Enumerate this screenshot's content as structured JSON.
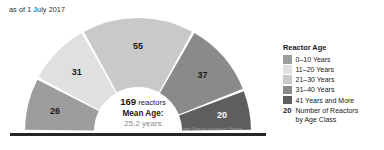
{
  "asof": "as of 1 July 2017",
  "center": {
    "total": "169",
    "total_unit": "reactors",
    "mean_label": "Mean Age:",
    "mean_value": "25.2 years"
  },
  "credit": "IAEA Power Reactor Information System",
  "legend": {
    "title": "Reactor Age",
    "items": [
      {
        "label": "0–10 Years",
        "color": "#9d9d9d"
      },
      {
        "label": "11–20 Years",
        "color": "#e0e0e0"
      },
      {
        "label": "21–30 Years",
        "color": "#c9c9c9"
      },
      {
        "label": "31–40 Years",
        "color": "#8a8a8a"
      },
      {
        "label": "41 Years and More",
        "color": "#5e5e5e"
      }
    ],
    "note_key": "20",
    "note_text_line1": "Number of Reactors",
    "note_text_line2": "by Age Class"
  },
  "chart_data": {
    "type": "pie",
    "variant": "half-donut",
    "title": "Reactor Age",
    "subtitle": "as of 1 July 2017",
    "categories": [
      "0–10 Years",
      "11–20 Years",
      "21–30 Years",
      "31–40 Years",
      "41 Years and More"
    ],
    "values": [
      26,
      31,
      55,
      37,
      20
    ],
    "value_labels": [
      "26",
      "31",
      "55",
      "37",
      "20"
    ],
    "colors": [
      "#9d9d9d",
      "#e0e0e0",
      "#c9c9c9",
      "#8a8a8a",
      "#5e5e5e"
    ],
    "label_colors": [
      "dark",
      "dark",
      "dark",
      "dark",
      "light"
    ],
    "total": 169,
    "total_label": "169 reactors",
    "mean_age": 25.2,
    "mean_age_label": "25.2 years",
    "unit": "Number of Reactors by Age Class",
    "legend_position": "right",
    "grid": false,
    "start_angle_deg": 180,
    "end_angle_deg": 0
  }
}
